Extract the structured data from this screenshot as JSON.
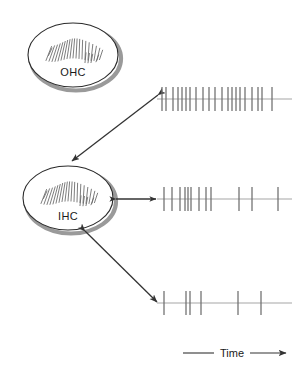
{
  "figure": {
    "background_color": "#ffffff",
    "width": 305,
    "height": 386
  },
  "colors": {
    "outline": "#2b2b2b",
    "shadow": "#9a9a9a",
    "spike": "#6e6e6e",
    "baseline": "#9b9b9b",
    "arrow": "#333333",
    "text": "#1a1a1a",
    "stereocilia": "#666666"
  },
  "cells": [
    {
      "id": "ohc",
      "label": "OHC",
      "name": "outer-hair-cell",
      "cx": 73,
      "cy": 55,
      "rx": 45,
      "ry": 32,
      "label_x": 73,
      "label_y": 76
    },
    {
      "id": "ihc",
      "label": "IHC",
      "name": "inner-hair-cell",
      "cx": 68,
      "cy": 198,
      "rx": 45,
      "ry": 32,
      "label_x": 68,
      "label_y": 220
    }
  ],
  "arrows": [
    {
      "id": "arrow-ohc-to-high",
      "name": "arrow-to-high-rate-train",
      "x1": 158,
      "y1": 95,
      "x2": 70,
      "y2": 163,
      "double_headed": false,
      "description": "OHC influence to high spontaneous rate fiber"
    },
    {
      "id": "arrow-ihc-medium",
      "name": "arrow-to-medium-rate-train",
      "x1": 114,
      "y1": 199,
      "x2": 156,
      "y2": 199,
      "double_headed": true,
      "description": "IHC to medium spontaneous rate fiber"
    },
    {
      "id": "arrow-ihc-low",
      "name": "arrow-to-low-rate-train",
      "x1": 83,
      "y1": 232,
      "x2": 157,
      "y2": 303,
      "double_headed": false,
      "description": "IHC to low spontaneous rate fiber"
    }
  ],
  "axis": {
    "label": "Time",
    "name": "time-axis",
    "line_x1": 183,
    "line_x2": 212,
    "label_x": 232,
    "label_y": 357,
    "arrow_x1": 252,
    "arrow_x2": 288,
    "y": 353
  },
  "chart_data": {
    "type": "raster",
    "xlabel": "Time",
    "ylabel": "",
    "grid": false,
    "legend_position": "none",
    "x_axis_units": "arbitrary (time increases to the right)",
    "spike_height": 24,
    "baseline_x_start": 157,
    "baseline_x_end": 292,
    "series": [
      {
        "name": "High spontaneous rate fiber",
        "row": 0,
        "baseline_y": 99,
        "spike_count": 21,
        "x": [
          162,
          166,
          173,
          178,
          182,
          186,
          190,
          196,
          203,
          209,
          215,
          222,
          228,
          232,
          236,
          240,
          245,
          252,
          258,
          262,
          272
        ],
        "values": [
          1,
          1,
          1,
          1,
          1,
          1,
          1,
          1,
          1,
          1,
          1,
          1,
          1,
          1,
          1,
          1,
          1,
          1,
          1,
          1,
          1
        ]
      },
      {
        "name": "Medium spontaneous rate fiber",
        "row": 1,
        "baseline_y": 199,
        "spike_count": 11,
        "x": [
          164,
          172,
          180,
          185,
          188,
          191,
          199,
          206,
          211,
          239,
          252,
          278
        ],
        "values": [
          1,
          1,
          1,
          1,
          1,
          1,
          1,
          1,
          1,
          1,
          1,
          1
        ]
      },
      {
        "name": "Low spontaneous rate fiber",
        "row": 2,
        "baseline_y": 303,
        "spike_count": 7,
        "x": [
          164,
          186,
          190,
          201,
          238,
          261
        ],
        "values": [
          1,
          1,
          1,
          1,
          1,
          1
        ]
      }
    ]
  },
  "stereocilia": {
    "name": "hair-bundle",
    "description": "fan of short slanted lines representing stereocilia in a V-shaped bundle",
    "count": 22
  }
}
